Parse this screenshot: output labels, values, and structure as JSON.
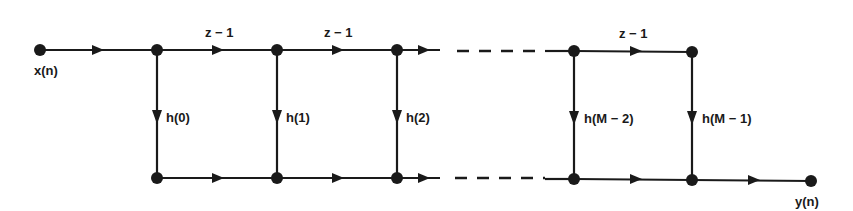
{
  "diagram": {
    "input_label": "x(n)",
    "output_label": "y(n)",
    "delay_labels": [
      "z − 1",
      "z − 1",
      "z − 1"
    ],
    "coefficient_labels": [
      "h(0)",
      "h(1)",
      "h(2)",
      "h(M − 2)",
      "h(M − 1)"
    ],
    "colors": {
      "ink": "#1a1a1a",
      "background": "#ffffff"
    }
  }
}
